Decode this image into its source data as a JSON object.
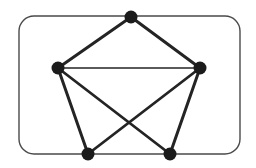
{
  "diagram": {
    "kind": "undirected-graph",
    "background": "#ffffff",
    "frame": {
      "shape": "rounded-rectangle",
      "x": 19,
      "y": 16,
      "width": 221,
      "height": 138,
      "corner_radius": 15,
      "stroke": "#4a4a4a",
      "stroke_width": 1.4,
      "fill": "none"
    },
    "node_style": {
      "radius": 6.5,
      "fill": "#1b1b1b"
    },
    "edge_style": {
      "stroke": "#242424"
    },
    "vertices": [
      {
        "id": "top",
        "x": 131,
        "y": 17
      },
      {
        "id": "left",
        "x": 58,
        "y": 68
      },
      {
        "id": "right",
        "x": 200,
        "y": 68
      },
      {
        "id": "bottom-left",
        "x": 88,
        "y": 154
      },
      {
        "id": "bottom-right",
        "x": 170,
        "y": 154
      }
    ],
    "edges": [
      {
        "from": "top",
        "to": "left",
        "width": 3.0
      },
      {
        "from": "top",
        "to": "right",
        "width": 3.0
      },
      {
        "from": "left",
        "to": "right",
        "width": 1.3
      },
      {
        "from": "left",
        "to": "bottom-left",
        "width": 3.0
      },
      {
        "from": "left",
        "to": "bottom-right",
        "width": 2.8
      },
      {
        "from": "right",
        "to": "bottom-left",
        "width": 2.8
      },
      {
        "from": "right",
        "to": "bottom-right",
        "width": 3.0
      }
    ]
  }
}
